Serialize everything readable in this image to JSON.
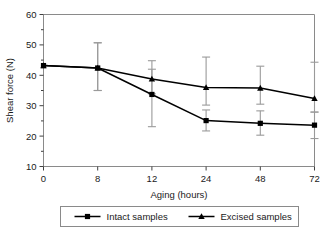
{
  "chart_data": {
    "type": "line",
    "title": "",
    "subtitle": "",
    "xlabel": "Aging (hours)",
    "ylabel": "Shear force (N)",
    "categories": [
      "0",
      "8",
      "12",
      "24",
      "48",
      "72"
    ],
    "x_tick_labels": [
      "0",
      "8",
      "12",
      "24",
      "48",
      "72"
    ],
    "y_tick_labels": [
      "10",
      "20",
      "30",
      "40",
      "50",
      "60"
    ],
    "y_ticks": [
      10,
      20,
      30,
      40,
      50,
      60
    ],
    "y_minor_ticks": [
      15,
      25,
      35,
      45,
      55
    ],
    "ylim": [
      10,
      60
    ],
    "grid": false,
    "legend_position": "bottom",
    "error_bar_style": "symmetric-std-dev",
    "series": [
      {
        "name": "Intact samples",
        "marker": "square",
        "color": "#000000",
        "values": [
          43.2,
          42.4,
          33.7,
          25.1,
          24.2,
          23.6
        ],
        "err_low": [
          43.2,
          35.0,
          23.1,
          21.7,
          20.3,
          19.2
        ],
        "err_high": [
          43.2,
          50.7,
          42.0,
          28.6,
          28.3,
          27.9
        ]
      },
      {
        "name": "Excised samples",
        "marker": "triangle",
        "color": "#000000",
        "values": [
          43.2,
          42.4,
          38.8,
          36.0,
          35.8,
          32.4
        ],
        "err_low": [
          43.2,
          35.0,
          33.9,
          30.2,
          30.5,
          27.9
        ],
        "err_high": [
          43.2,
          50.7,
          44.8,
          46.0,
          43.0,
          44.3
        ]
      }
    ]
  },
  "legend": {
    "entries": [
      {
        "label": "Intact samples",
        "marker": "square"
      },
      {
        "label": "Excised samples",
        "marker": "triangle"
      }
    ]
  },
  "colors": {
    "series": "#000000",
    "axis": "#404040",
    "error_bar": "#9a9a9a",
    "frame": "#8a8a8a",
    "legend_border": "#8a8a8a",
    "background": "#ffffff"
  }
}
